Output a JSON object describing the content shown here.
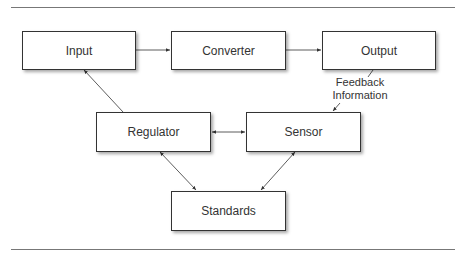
{
  "diagram": {
    "nodes": {
      "input": "Input",
      "converter": "Converter",
      "output": "Output",
      "regulator": "Regulator",
      "sensor": "Sensor",
      "standards": "Standards"
    },
    "annotations": {
      "feedback_line1": "Feedback",
      "feedback_line2": "Information"
    },
    "edges": [
      {
        "from": "Input",
        "to": "Converter",
        "type": "arrow"
      },
      {
        "from": "Converter",
        "to": "Output",
        "type": "arrow"
      },
      {
        "from": "Output",
        "to": "Sensor",
        "type": "arrow",
        "label": "Feedback Information"
      },
      {
        "from": "Regulator",
        "to": "Input",
        "type": "arrow"
      },
      {
        "from": "Regulator",
        "to": "Sensor",
        "type": "bidirectional"
      },
      {
        "from": "Regulator",
        "to": "Standards",
        "type": "bidirectional"
      },
      {
        "from": "Sensor",
        "to": "Standards",
        "type": "bidirectional"
      }
    ],
    "colors": {
      "line": "#333333",
      "rule": "#777777"
    }
  }
}
